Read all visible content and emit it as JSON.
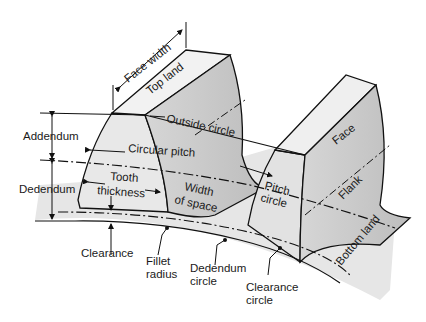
{
  "diagram": {
    "labels": {
      "face_width": "Face width",
      "top_land": "Top land",
      "outside_circle": "Outside circle",
      "addendum": "Addendum",
      "circular_pitch": "Circular pitch",
      "dedendum": "Dedendum",
      "tooth": "Tooth",
      "thickness": "thickness",
      "width": "Width",
      "of_space": "of space",
      "pitch": "Pitch",
      "circle": "circle",
      "face": "Face",
      "flank": "Flank",
      "bottom_land": "Bottom land",
      "clearance": "Clearance",
      "fillet": "Fillet",
      "radius": "radius",
      "dedendum_c": "Dedendum",
      "dedendum_circle": "circle",
      "clearance_c": "Clearance",
      "clearance_circle": "circle"
    },
    "colors": {
      "line": "#111111",
      "face_light": "#ececec",
      "face_mid": "#d8d8d8",
      "face_dark": "#c4c4c4",
      "ground": "#e4e4e4"
    }
  }
}
